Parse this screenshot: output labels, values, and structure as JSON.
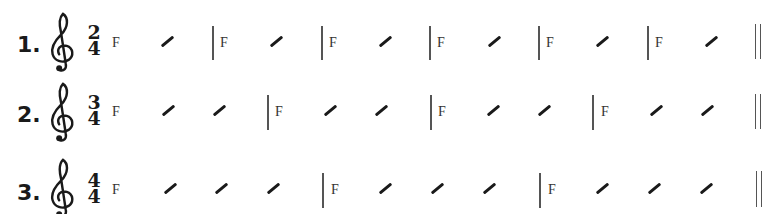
{
  "exercises": [
    {
      "number": "1.",
      "clef": "treble-clef",
      "time_signature": {
        "top": "2",
        "bottom": "4"
      },
      "measures": [
        {
          "chord": "F",
          "slashes": 1
        },
        {
          "chord": "F",
          "slashes": 1
        },
        {
          "chord": "F",
          "slashes": 1
        },
        {
          "chord": "F",
          "slashes": 1
        },
        {
          "chord": "F",
          "slashes": 1
        },
        {
          "chord": "F",
          "slashes": 1
        }
      ],
      "ending": "double-barline"
    },
    {
      "number": "2.",
      "clef": "treble-clef",
      "time_signature": {
        "top": "3",
        "bottom": "4"
      },
      "measures": [
        {
          "chord": "F",
          "slashes": 2
        },
        {
          "chord": "F",
          "slashes": 2
        },
        {
          "chord": "F",
          "slashes": 2
        },
        {
          "chord": "F",
          "slashes": 2
        }
      ],
      "ending": "double-barline"
    },
    {
      "number": "3.",
      "clef": "treble-clef",
      "time_signature": {
        "top": "4",
        "bottom": "4"
      },
      "measures": [
        {
          "chord": "F",
          "slashes": 3
        },
        {
          "chord": "F",
          "slashes": 3
        },
        {
          "chord": "F",
          "slashes": 3
        }
      ],
      "ending": "double-barline"
    }
  ],
  "colors": {
    "ink": "#1a1a1a",
    "barline": "#555555",
    "chord_text": "#333333",
    "background": "#ffffff"
  }
}
